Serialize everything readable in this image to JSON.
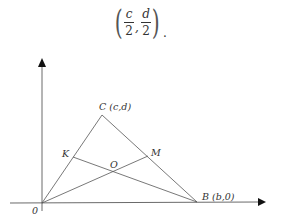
{
  "formula": {
    "left_paren": "(",
    "right_paren": ")",
    "frac1": {
      "numerator": "c",
      "denominator": "2"
    },
    "separator": ",",
    "frac2": {
      "numerator": "d",
      "denominator": "2"
    },
    "trailing": "."
  },
  "diagram": {
    "points": {
      "O_origin": {
        "label": "0",
        "x": 42,
        "y": 203
      },
      "B": {
        "label": "B (b,0)",
        "x": 197,
        "y": 202
      },
      "C": {
        "label": "C (c,d)",
        "x": 102,
        "y": 114
      },
      "K": {
        "label": "K",
        "x": 73,
        "y": 157
      },
      "M": {
        "label": "M",
        "x": 148,
        "y": 156
      },
      "O": {
        "label": "O",
        "x": 114,
        "y": 171
      }
    },
    "line_color": "#555555",
    "axis_color": "#444444"
  }
}
